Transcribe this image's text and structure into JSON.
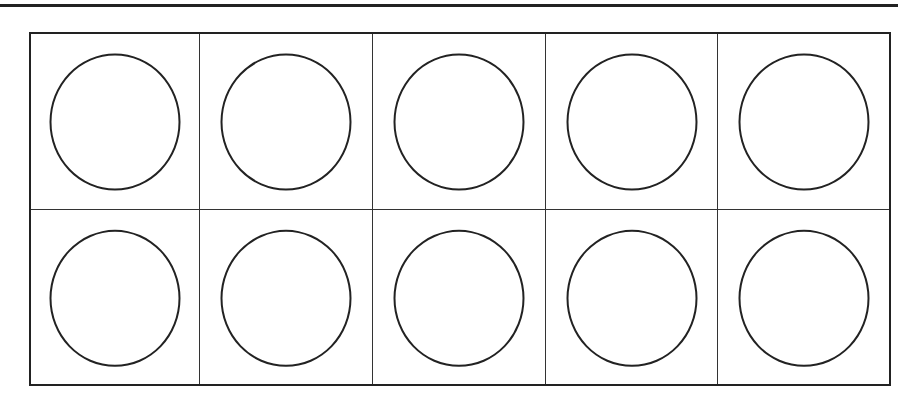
{
  "diagram": {
    "type": "ten-frame",
    "rows": 2,
    "columns": 5,
    "cells": [
      {
        "row": 1,
        "col": 1,
        "counter": "empty-circle"
      },
      {
        "row": 1,
        "col": 2,
        "counter": "empty-circle"
      },
      {
        "row": 1,
        "col": 3,
        "counter": "empty-circle"
      },
      {
        "row": 1,
        "col": 4,
        "counter": "empty-circle"
      },
      {
        "row": 1,
        "col": 5,
        "counter": "empty-circle"
      },
      {
        "row": 2,
        "col": 1,
        "counter": "empty-circle"
      },
      {
        "row": 2,
        "col": 2,
        "counter": "empty-circle"
      },
      {
        "row": 2,
        "col": 3,
        "counter": "empty-circle"
      },
      {
        "row": 2,
        "col": 4,
        "counter": "empty-circle"
      },
      {
        "row": 2,
        "col": 5,
        "counter": "empty-circle"
      }
    ],
    "colors": {
      "line": "#222222",
      "background": "#ffffff"
    }
  }
}
